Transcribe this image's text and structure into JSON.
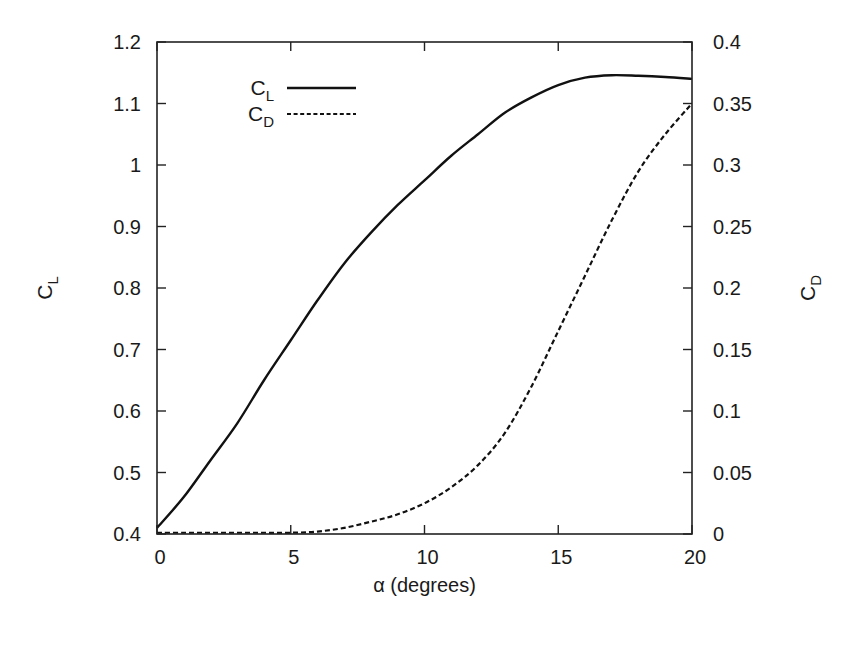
{
  "chart_data": {
    "type": "line",
    "title": "",
    "xlabel": "α (degrees)",
    "ylabel": "C_L",
    "y2label": "C_D",
    "xlim": [
      0,
      20
    ],
    "ylim": [
      0.4,
      1.2
    ],
    "y2lim": [
      0,
      0.4
    ],
    "grid": false,
    "legend_position": "upper-left-inside",
    "x_ticks": [
      "0",
      "5",
      "10",
      "15",
      "20"
    ],
    "y_ticks": [
      "0.4",
      "0.5",
      "0.6",
      "0.7",
      "0.8",
      "0.9",
      "1",
      "1.1",
      "1.2"
    ],
    "y2_ticks": [
      "0",
      "0.05",
      "0.1",
      "0.15",
      "0.2",
      "0.25",
      "0.3",
      "0.35",
      "0.4"
    ],
    "series": [
      {
        "name": "C_L",
        "label_main": "C",
        "label_sub": "L",
        "axis": "left",
        "style": "solid",
        "x": [
          0,
          1,
          2,
          3,
          4,
          5,
          6,
          7,
          8,
          9,
          10,
          11,
          12,
          13,
          14,
          15,
          16,
          17,
          18,
          19,
          20
        ],
        "values": [
          0.41,
          0.46,
          0.52,
          0.58,
          0.65,
          0.715,
          0.78,
          0.84,
          0.89,
          0.935,
          0.975,
          1.015,
          1.05,
          1.085,
          1.11,
          1.13,
          1.142,
          1.146,
          1.145,
          1.143,
          1.14
        ]
      },
      {
        "name": "C_D",
        "label_main": "C",
        "label_sub": "D",
        "axis": "right",
        "style": "dashed",
        "x": [
          0,
          1,
          2,
          3,
          4,
          5,
          6,
          7,
          8,
          9,
          10,
          11,
          12,
          13,
          14,
          15,
          16,
          17,
          18,
          19,
          20
        ],
        "values": [
          0.001,
          0.001,
          0.001,
          0.001,
          0.001,
          0.001,
          0.002,
          0.005,
          0.01,
          0.016,
          0.025,
          0.038,
          0.056,
          0.082,
          0.12,
          0.165,
          0.21,
          0.255,
          0.295,
          0.325,
          0.35
        ]
      }
    ]
  }
}
